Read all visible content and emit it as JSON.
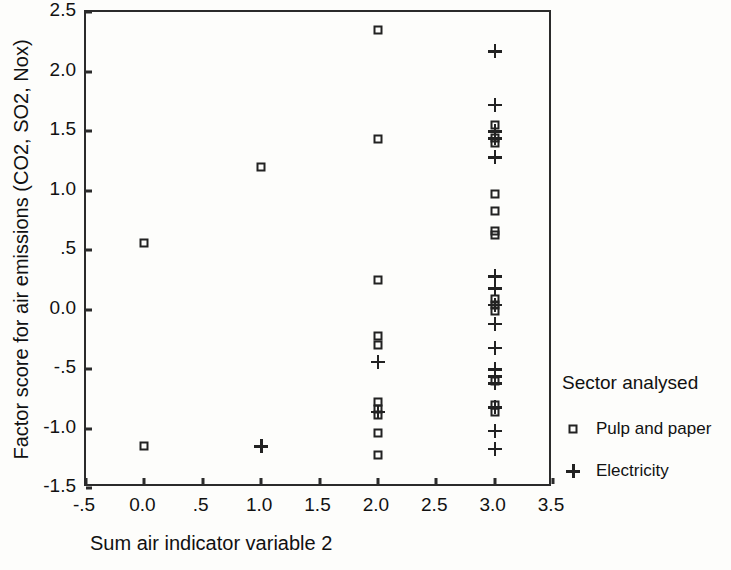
{
  "chart_data": {
    "type": "scatter",
    "title": "",
    "xlabel": "Sum air indicator variable 2",
    "ylabel": "Factor score for air emissions (CO2, SO2, Nox)",
    "xlim": [
      -0.5,
      3.5
    ],
    "ylim": [
      -1.5,
      2.5
    ],
    "xticks": [
      "-.5",
      "0.0",
      ".5",
      "1.0",
      "1.5",
      "2.0",
      "2.5",
      "3.0",
      "3.5"
    ],
    "xtick_values": [
      -0.5,
      0.0,
      0.5,
      1.0,
      1.5,
      2.0,
      2.5,
      3.0,
      3.5
    ],
    "yticks": [
      "2.5",
      "2.0",
      "1.5",
      "1.0",
      ".5",
      "0.0",
      "-.5",
      "-1.0",
      "-1.5"
    ],
    "ytick_values": [
      2.5,
      2.0,
      1.5,
      1.0,
      0.5,
      0.0,
      -0.5,
      -1.0,
      -1.5
    ],
    "grid": false,
    "legend_position": "right",
    "legend_title": "Sector analysed",
    "series": [
      {
        "name": "Pulp and paper",
        "marker": "square",
        "points": [
          [
            0.0,
            0.56
          ],
          [
            0.0,
            -1.15
          ],
          [
            1.0,
            1.2
          ],
          [
            2.0,
            2.35
          ],
          [
            2.0,
            1.43
          ],
          [
            2.0,
            0.25
          ],
          [
            2.0,
            -0.22
          ],
          [
            2.0,
            -0.3
          ],
          [
            2.0,
            -0.78
          ],
          [
            2.0,
            -0.84
          ],
          [
            2.0,
            -0.89
          ],
          [
            2.0,
            -1.04
          ],
          [
            2.0,
            -1.22
          ],
          [
            3.0,
            1.55
          ],
          [
            3.0,
            1.44
          ],
          [
            3.0,
            1.4
          ],
          [
            3.0,
            0.97
          ],
          [
            3.0,
            0.83
          ],
          [
            3.0,
            0.66
          ],
          [
            3.0,
            0.63
          ],
          [
            3.0,
            0.09
          ],
          [
            3.0,
            0.04
          ],
          [
            3.0,
            -0.01
          ],
          [
            3.0,
            -0.6
          ],
          [
            3.0,
            -0.8
          ],
          [
            3.0,
            -0.86
          ]
        ]
      },
      {
        "name": "Electricity",
        "marker": "plus",
        "points": [
          [
            1.0,
            -1.15
          ],
          [
            2.0,
            -0.44
          ],
          [
            2.0,
            -0.86
          ],
          [
            3.0,
            2.17
          ],
          [
            3.0,
            1.72
          ],
          [
            3.0,
            1.5
          ],
          [
            3.0,
            1.44
          ],
          [
            3.0,
            1.28
          ],
          [
            3.0,
            0.28
          ],
          [
            3.0,
            0.18
          ],
          [
            3.0,
            0.04
          ],
          [
            3.0,
            -0.12
          ],
          [
            3.0,
            -0.32
          ],
          [
            3.0,
            -0.5
          ],
          [
            3.0,
            -0.56
          ],
          [
            3.0,
            -0.62
          ],
          [
            3.0,
            -0.82
          ],
          [
            3.0,
            -1.02
          ],
          [
            3.0,
            -1.17
          ]
        ]
      }
    ]
  }
}
